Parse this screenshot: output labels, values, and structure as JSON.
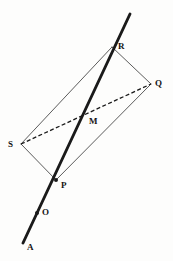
{
  "figure": {
    "kind": "geometry-diagram",
    "width": 173,
    "height": 261,
    "background_color": "#fdfdfc",
    "ink_color": "#1a1a1a",
    "thin_line_color": "#4a4a4a"
  },
  "points": {
    "A": {
      "label": "A",
      "x": 23,
      "y": 243,
      "label_x": 27,
      "label_y": 243,
      "marker": false
    },
    "O": {
      "label": "O",
      "x": 37,
      "y": 213,
      "label_x": 42,
      "label_y": 208,
      "marker": true
    },
    "P": {
      "label": "P",
      "x": 56,
      "y": 180,
      "label_x": 61,
      "label_y": 181,
      "marker": true
    },
    "M": {
      "label": "M",
      "x": 85,
      "y": 119,
      "label_x": 89,
      "label_y": 117,
      "marker": false
    },
    "R": {
      "label": "R",
      "x": 112,
      "y": 47,
      "label_x": 118,
      "label_y": 42,
      "marker": false
    },
    "Q": {
      "label": "Q",
      "x": 151,
      "y": 84,
      "label_x": 155,
      "label_y": 79,
      "marker": false
    },
    "S": {
      "label": "S",
      "x": 21,
      "y": 144,
      "label_x": 8,
      "label_y": 140,
      "marker": false
    }
  },
  "segments": {
    "thick_ray": {
      "name": "line-A-through-O-P-M-R",
      "from": "A",
      "to": "top",
      "x1": 23,
      "y1": 243,
      "x2": 130,
      "y2": 14,
      "style": "solid",
      "weight": 2.9,
      "color": "#1a1a1a"
    },
    "quad_edges": [
      {
        "name": "edge-S-R",
        "x1": 21,
        "y1": 144,
        "x2": 112,
        "y2": 47,
        "style": "solid",
        "weight": 0.9,
        "color": "#4a4a4a"
      },
      {
        "name": "edge-R-Q",
        "x1": 112,
        "y1": 47,
        "x2": 151,
        "y2": 84,
        "style": "solid",
        "weight": 0.9,
        "color": "#4a4a4a"
      },
      {
        "name": "edge-Q-P",
        "x1": 151,
        "y1": 84,
        "x2": 56,
        "y2": 180,
        "style": "solid",
        "weight": 0.9,
        "color": "#4a4a4a"
      },
      {
        "name": "edge-P-S",
        "x1": 56,
        "y1": 180,
        "x2": 21,
        "y2": 144,
        "style": "solid",
        "weight": 0.9,
        "color": "#4a4a4a"
      }
    ],
    "diagonal_dashed": {
      "name": "diagonal-S-Q",
      "x1": 21,
      "y1": 144,
      "x2": 151,
      "y2": 84,
      "style": "dashed",
      "dash": "4 2.4",
      "weight": 1.3,
      "color": "#1a1a1a"
    }
  },
  "markers": {
    "radius": 2.0,
    "color": "#1a1a1a"
  }
}
